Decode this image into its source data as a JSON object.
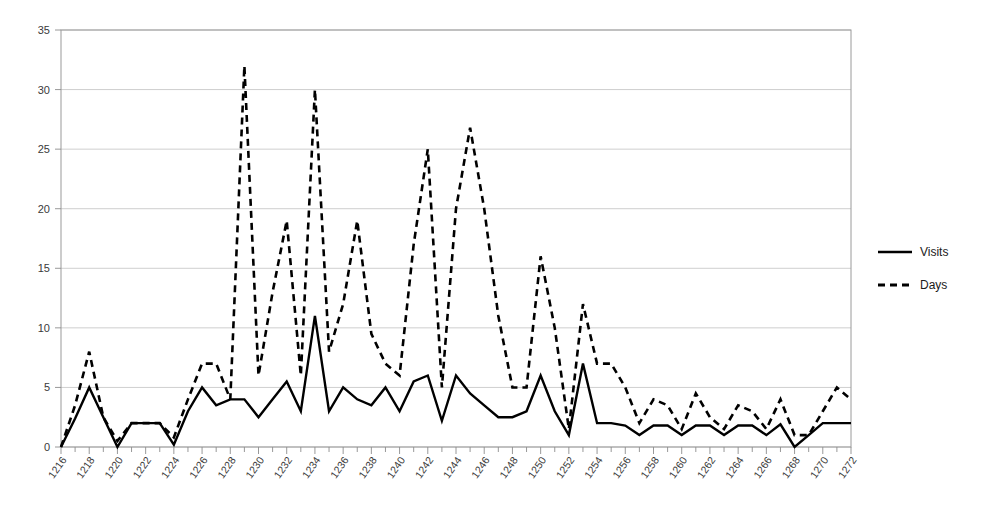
{
  "chart_data": {
    "type": "line",
    "title": "",
    "xlabel": "",
    "ylabel": "",
    "xlim": [
      1216,
      1272
    ],
    "ylim": [
      0,
      35
    ],
    "ytick_step": 5,
    "xtick_step": 2,
    "minor_xtick_step": 1,
    "grid": true,
    "legend_position": "right",
    "yticks": [
      "0",
      "5",
      "10",
      "15",
      "20",
      "25",
      "30",
      "35"
    ],
    "x": [
      1216,
      1217,
      1218,
      1219,
      1220,
      1221,
      1222,
      1223,
      1224,
      1225,
      1226,
      1227,
      1228,
      1229,
      1230,
      1231,
      1232,
      1233,
      1234,
      1235,
      1236,
      1237,
      1238,
      1239,
      1240,
      1241,
      1242,
      1243,
      1244,
      1245,
      1246,
      1247,
      1248,
      1249,
      1250,
      1251,
      1252,
      1253,
      1254,
      1255,
      1256,
      1257,
      1258,
      1259,
      1260,
      1261,
      1262,
      1263,
      1264,
      1265,
      1266,
      1267,
      1268,
      1269,
      1270,
      1271,
      1272
    ],
    "xtick_labels": [
      "1216",
      "1218",
      "1220",
      "1222",
      "1224",
      "1226",
      "1228",
      "1230",
      "1232",
      "1234",
      "1236",
      "1238",
      "1240",
      "1242",
      "1244",
      "1246",
      "1248",
      "1250",
      "1252",
      "1254",
      "1256",
      "1258",
      "1260",
      "1262",
      "1264",
      "1266",
      "1268",
      "1270",
      "1272"
    ],
    "series": [
      {
        "name": "Visits",
        "style": "solid",
        "color": "#000000",
        "values": [
          0,
          2.4,
          5,
          2.5,
          0,
          2,
          2,
          2,
          0.2,
          3,
          5,
          3.5,
          4,
          4,
          2.5,
          4,
          5.5,
          3,
          11,
          3,
          5,
          4,
          3.5,
          5,
          3,
          5.5,
          6,
          2.2,
          6,
          4.5,
          3.5,
          2.5,
          2.5,
          3,
          6,
          3,
          1,
          7,
          2,
          2,
          1.8,
          1,
          1.8,
          1.8,
          1,
          1.8,
          1.8,
          1,
          1.8,
          1.8,
          1,
          1.9,
          0,
          1,
          2,
          2,
          2
        ]
      },
      {
        "name": "Days",
        "style": "dashed",
        "color": "#000000",
        "values": [
          0,
          3.5,
          8,
          2.5,
          0.5,
          2,
          2,
          2,
          0.8,
          4,
          7,
          7,
          4,
          32,
          6,
          13,
          19,
          6,
          30,
          8,
          12,
          19,
          9.5,
          7,
          6,
          17,
          25,
          5,
          20,
          26.8,
          20,
          11,
          5,
          5,
          16,
          10,
          1.5,
          12,
          7,
          7,
          5,
          2,
          4,
          3.5,
          1.5,
          4.5,
          2.5,
          1.5,
          3.5,
          3,
          1.5,
          4,
          1,
          1,
          3,
          5,
          4
        ]
      }
    ]
  },
  "legend": {
    "items": [
      {
        "label": "Visits",
        "style": "solid"
      },
      {
        "label": "Days",
        "style": "dashed"
      }
    ]
  }
}
